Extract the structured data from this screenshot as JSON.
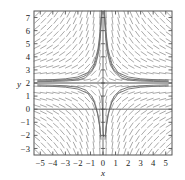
{
  "figure": {
    "name": "slope-field-plot",
    "background": "#ffffff",
    "frame_color": "#555555",
    "field_color": "#8c8c8c",
    "curve_color": "#6e6e6e",
    "axis_color": "#4a4a4a",
    "text_color": "#1a1a1a"
  },
  "axes": {
    "x_label": "x",
    "y_label": "y",
    "x_ticks": [
      "-5",
      "-4",
      "-3",
      "-2",
      "-1",
      "0",
      "1",
      "2",
      "3",
      "4",
      "5"
    ],
    "y_ticks": [
      "7",
      "6",
      "5",
      "4",
      "3",
      "2",
      "1",
      "0",
      "-1",
      "-2",
      "-3"
    ]
  },
  "chart_data": {
    "type": "line",
    "subtype": "slope-field-with-solution-curves",
    "title": "",
    "xlabel": "x",
    "ylabel": "y",
    "xlim": [
      -5.5,
      5.5
    ],
    "ylim": [
      -3.5,
      7.5
    ],
    "xticks": [
      -5,
      -4,
      -3,
      -2,
      -1,
      0,
      1,
      2,
      3,
      4,
      5
    ],
    "yticks": [
      -3,
      -2,
      -1,
      0,
      1,
      2,
      3,
      4,
      5,
      6,
      7
    ],
    "grid": false,
    "legend": "none",
    "equilibrium_line_y": 2,
    "critical_x": 0,
    "field_grid": {
      "x_start": -5.25,
      "x_step": 0.5,
      "x_count": 22,
      "y_start": -3.25,
      "y_step": 0.5,
      "y_count": 22,
      "segment_length": 6.5
    },
    "slope_rule": "dy/dx proportional to -(y-2)/x ; segments flatten along y=2 and steepen near x=0",
    "annotations": [
      "Horizontal asymptote / equilibrium at y = 2",
      "Solution curves funnel toward the vertical axis x = 0",
      "Field tilts up-right in upper-left and lower-right regions",
      "Field tilts down-right in upper-right and lower-left regions"
    ],
    "solution_curves": [
      {
        "name": "upper-left-branch-1",
        "points": [
          [
            -5.2,
            2.22
          ],
          [
            -4,
            2.26
          ],
          [
            -3,
            2.32
          ],
          [
            -2,
            2.46
          ],
          [
            -1.2,
            2.8
          ],
          [
            -0.7,
            3.5
          ],
          [
            -0.4,
            4.6
          ],
          [
            -0.22,
            6.0
          ],
          [
            -0.12,
            7.5
          ]
        ]
      },
      {
        "name": "upper-left-branch-2",
        "points": [
          [
            -5.2,
            2.15
          ],
          [
            -4,
            2.18
          ],
          [
            -3,
            2.22
          ],
          [
            -2,
            2.33
          ],
          [
            -1.3,
            2.6
          ],
          [
            -0.8,
            3.1
          ],
          [
            -0.5,
            3.9
          ],
          [
            -0.3,
            5.0
          ],
          [
            -0.17,
            6.4
          ],
          [
            -0.1,
            7.5
          ]
        ]
      },
      {
        "name": "upper-left-branch-3",
        "points": [
          [
            -5.2,
            2.1
          ],
          [
            -4,
            2.12
          ],
          [
            -3,
            2.15
          ],
          [
            -2,
            2.22
          ],
          [
            -1.4,
            2.4
          ],
          [
            -0.95,
            2.8
          ],
          [
            -0.6,
            3.35
          ],
          [
            -0.38,
            4.2
          ],
          [
            -0.22,
            5.4
          ],
          [
            -0.12,
            7.0
          ]
        ]
      },
      {
        "name": "upper-right-branch-1",
        "points": [
          [
            5.2,
            2.22
          ],
          [
            4,
            2.26
          ],
          [
            3,
            2.32
          ],
          [
            2,
            2.46
          ],
          [
            1.2,
            2.8
          ],
          [
            0.7,
            3.5
          ],
          [
            0.4,
            4.6
          ],
          [
            0.22,
            6.0
          ],
          [
            0.12,
            7.5
          ]
        ]
      },
      {
        "name": "upper-right-branch-2",
        "points": [
          [
            5.2,
            2.15
          ],
          [
            4,
            2.18
          ],
          [
            3,
            2.22
          ],
          [
            2,
            2.33
          ],
          [
            1.3,
            2.6
          ],
          [
            0.8,
            3.1
          ],
          [
            0.5,
            3.9
          ],
          [
            0.3,
            5.0
          ],
          [
            0.17,
            6.4
          ],
          [
            0.1,
            7.5
          ]
        ]
      },
      {
        "name": "upper-right-branch-3",
        "points": [
          [
            5.2,
            2.1
          ],
          [
            4,
            2.12
          ],
          [
            3,
            2.15
          ],
          [
            2,
            2.22
          ],
          [
            1.4,
            2.4
          ],
          [
            0.95,
            2.8
          ],
          [
            0.6,
            3.35
          ],
          [
            0.38,
            4.2
          ],
          [
            0.22,
            5.4
          ],
          [
            0.12,
            7.0
          ]
        ]
      },
      {
        "name": "lower-left-branch-1",
        "points": [
          [
            -5.2,
            1.78
          ],
          [
            -4,
            1.74
          ],
          [
            -3,
            1.68
          ],
          [
            -2,
            1.54
          ],
          [
            -1.2,
            1.2
          ],
          [
            -0.7,
            0.5
          ],
          [
            -0.45,
            -0.3
          ],
          [
            -0.28,
            -1.2
          ],
          [
            -0.18,
            -2.1
          ]
        ]
      },
      {
        "name": "lower-left-branch-2",
        "points": [
          [
            -5.2,
            1.86
          ],
          [
            -4,
            1.83
          ],
          [
            -3,
            1.79
          ],
          [
            -2,
            1.68
          ],
          [
            -1.35,
            1.45
          ],
          [
            -0.9,
            1.0
          ],
          [
            -0.6,
            0.35
          ],
          [
            -0.38,
            -0.5
          ],
          [
            -0.24,
            -1.5
          ],
          [
            -0.16,
            -2.3
          ]
        ]
      },
      {
        "name": "lower-right-branch-1",
        "points": [
          [
            5.2,
            1.78
          ],
          [
            4,
            1.74
          ],
          [
            3,
            1.68
          ],
          [
            2,
            1.54
          ],
          [
            1.2,
            1.2
          ],
          [
            0.7,
            0.5
          ],
          [
            0.45,
            -0.3
          ],
          [
            0.28,
            -1.2
          ],
          [
            0.18,
            -2.1
          ]
        ]
      },
      {
        "name": "lower-right-branch-2",
        "points": [
          [
            5.2,
            1.86
          ],
          [
            4,
            1.83
          ],
          [
            3,
            1.79
          ],
          [
            2,
            1.68
          ],
          [
            1.35,
            1.45
          ],
          [
            0.9,
            1.0
          ],
          [
            0.6,
            0.35
          ],
          [
            0.38,
            -0.5
          ],
          [
            0.24,
            -1.5
          ],
          [
            0.16,
            -2.3
          ]
        ]
      },
      {
        "name": "axis-descending-curve",
        "points": [
          [
            -0.1,
            1.0
          ],
          [
            -0.05,
            0.2
          ],
          [
            -0.02,
            -0.8
          ],
          [
            0.0,
            -1.6
          ],
          [
            0.05,
            -2.1
          ]
        ]
      }
    ]
  }
}
